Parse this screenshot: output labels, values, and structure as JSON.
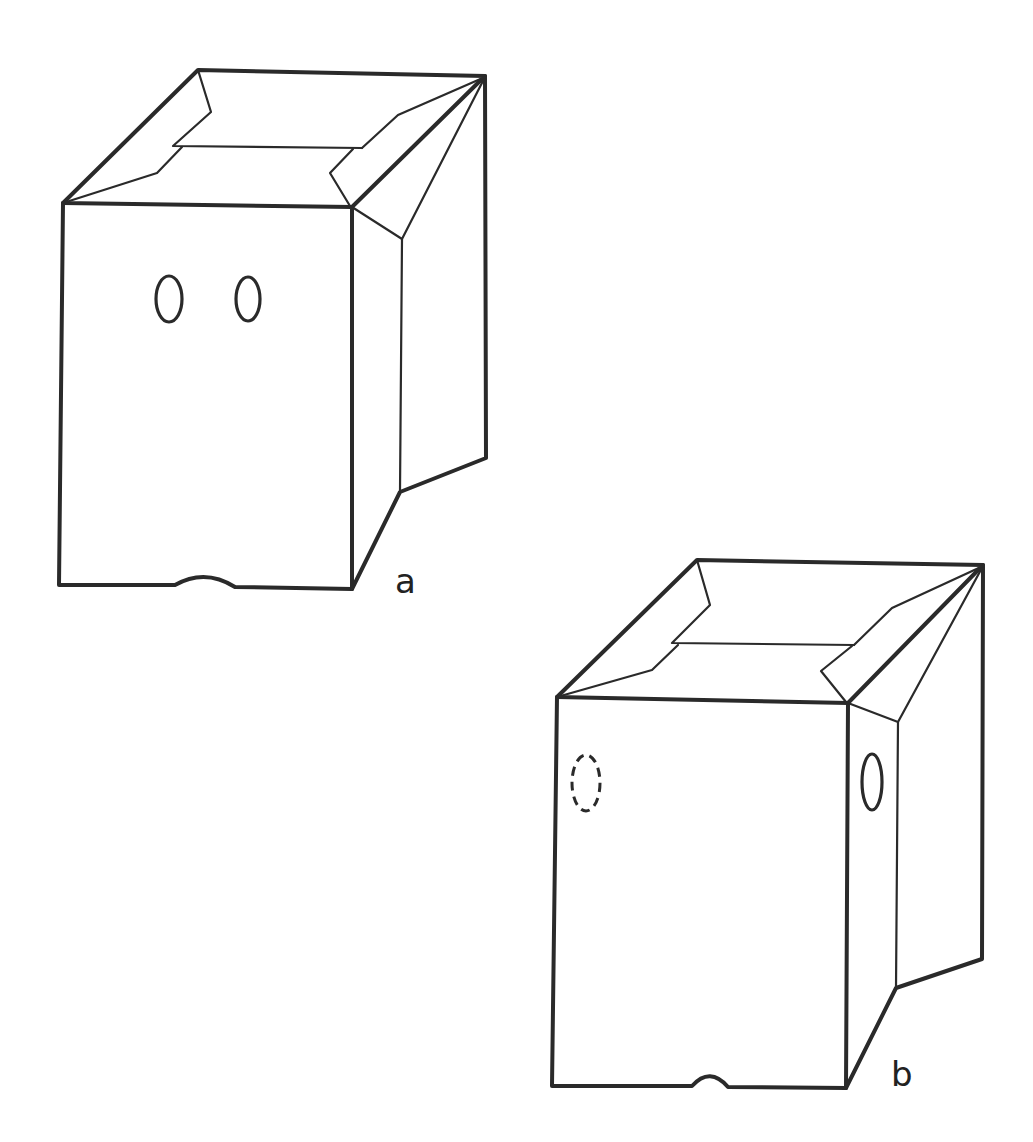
{
  "figure": {
    "background": "#ffffff",
    "stroke_color": "#2a2a2a",
    "panels": [
      {
        "id": "a",
        "label": "a",
        "description": "Open-top box, front view, two holes visible on front face, notch at bottom edge",
        "holes": [
          {
            "name": "front-hole-left",
            "style": "solid"
          },
          {
            "name": "front-hole-right",
            "style": "solid"
          }
        ]
      },
      {
        "id": "b",
        "label": "b",
        "description": "Same open-top box rotated; one hidden hole (dashed) on left, one visible hole on side panel, notch at bottom edge",
        "holes": [
          {
            "name": "hidden-hole-left",
            "style": "dashed"
          },
          {
            "name": "side-hole-right",
            "style": "solid"
          }
        ]
      }
    ]
  }
}
